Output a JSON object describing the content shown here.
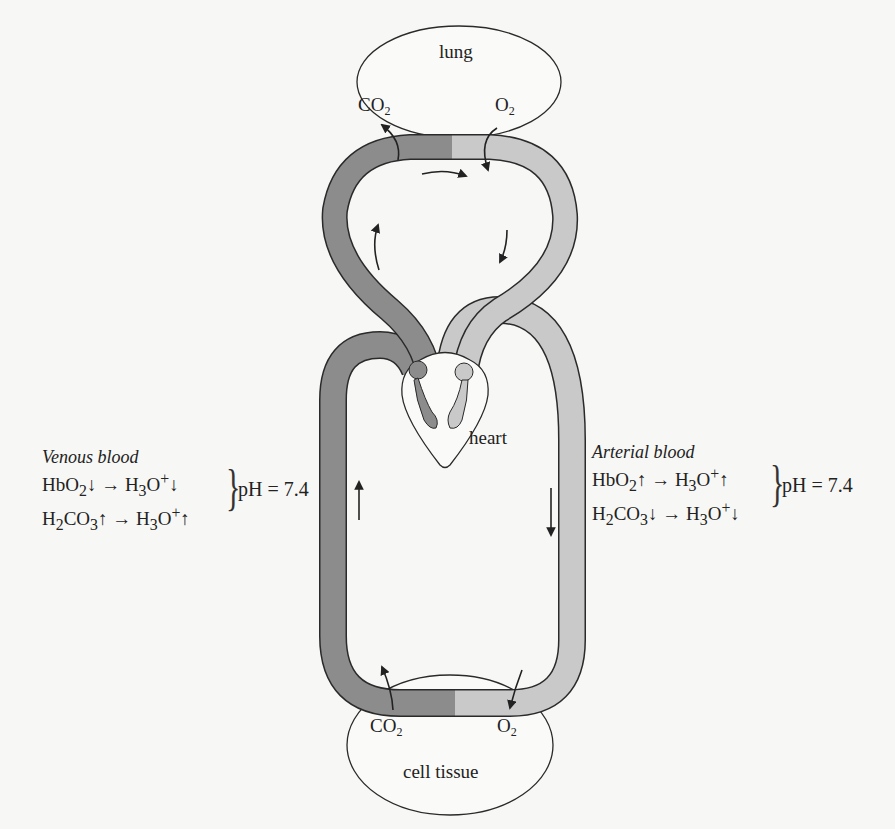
{
  "diagram": {
    "colors": {
      "venous": "#8c8c8c",
      "arterial": "#c9c9c9",
      "outline": "#2a2a2a",
      "background": "#f7f7f5"
    },
    "organs": {
      "lung": {
        "label": "lung",
        "co2": "CO",
        "co2_sub": "2",
        "o2": "O",
        "o2_sub": "2"
      },
      "heart": {
        "label": "heart"
      },
      "tissue": {
        "label": "cell tissue",
        "co2": "CO",
        "co2_sub": "2",
        "o2": "O",
        "o2_sub": "2"
      }
    },
    "venous": {
      "title": "Venous blood",
      "line1": {
        "a": "HbO",
        "a_sub": "2",
        "a_arrow": "↓",
        "arrow": "→",
        "b": "H",
        "b_sub": "3",
        "b2": "O",
        "b_sup": "+",
        "b_arrow": "↓"
      },
      "line2": {
        "a": "H",
        "a_sub": "2",
        "a2": "CO",
        "a_sub2": "3",
        "a_arrow": "↑",
        "arrow": "→",
        "b": "H",
        "b_sub": "3",
        "b2": "O",
        "b_sup": "+",
        "b_arrow": "↑"
      },
      "brace": "}",
      "ph": "pH = 7.4"
    },
    "arterial": {
      "title": "Arterial blood",
      "line1": {
        "a": "HbO",
        "a_sub": "2",
        "a_arrow": "↑",
        "arrow": "→",
        "b": "H",
        "b_sub": "3",
        "b2": "O",
        "b_sup": "+",
        "b_arrow": "↑"
      },
      "line2": {
        "a": "H",
        "a_sub": "2",
        "a2": "CO",
        "a_sub2": "3",
        "a_arrow": "↓",
        "arrow": "→",
        "b": "H",
        "b_sub": "3",
        "b2": "O",
        "b_sup": "+",
        "b_arrow": "↓"
      },
      "brace": "}",
      "ph": "pH = 7.4"
    },
    "flow_arrows": [
      "pulmonary-left-up",
      "pulmonary-top-right",
      "pulmonary-right-down",
      "systemic-left-up",
      "systemic-right-down"
    ]
  }
}
